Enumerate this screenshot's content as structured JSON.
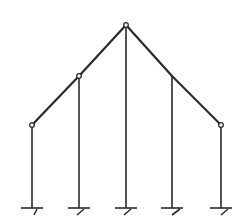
{
  "diagram": {
    "type": "structural-frame",
    "stroke_color": "#2a2a2a",
    "background": "#ffffff",
    "nodes": [
      {
        "id": "n1",
        "x": 32,
        "y": 125,
        "hinge": true
      },
      {
        "id": "n2",
        "x": 79,
        "y": 76,
        "hinge": true
      },
      {
        "id": "n3",
        "x": 126,
        "y": 25,
        "hinge": true
      },
      {
        "id": "n4",
        "x": 172,
        "y": 76,
        "hinge": false
      },
      {
        "id": "n5",
        "x": 221,
        "y": 125,
        "hinge": true
      }
    ],
    "base_y": 208,
    "supports": [
      "fixed",
      "fixed",
      "fixed",
      "fixed",
      "fixed"
    ]
  }
}
